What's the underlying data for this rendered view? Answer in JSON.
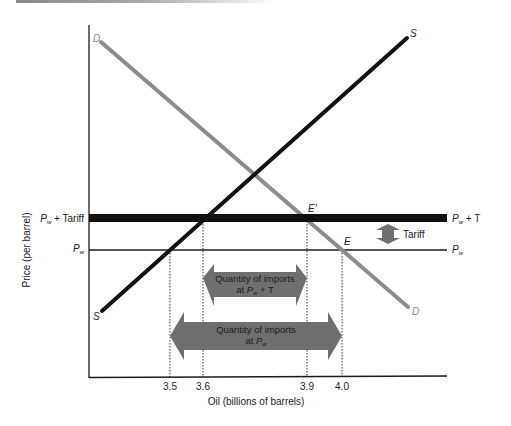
{
  "diagram": {
    "title": "",
    "y_axis_label": "Price (per barrel)",
    "x_axis_label": "Oil (billions of barrels)",
    "x_ticks": [
      {
        "value": "3.5",
        "x": 170
      },
      {
        "value": "3.6",
        "x": 203
      },
      {
        "value": "3.9",
        "x": 307
      },
      {
        "value": "4.0",
        "x": 342
      }
    ],
    "price_levels": {
      "tariff_left_label_main": "P",
      "tariff_left_label_sub": "w",
      "tariff_left_label_rest": " + Tariff",
      "world_left_label_main": "P",
      "world_left_label_sub": "w",
      "tariff_right_label_main": "P",
      "tariff_right_label_sub": "w",
      "tariff_right_label_rest": " + T",
      "world_right_label_main": "P",
      "world_right_label_sub": "w"
    },
    "curves": {
      "supply_label_top": "S",
      "supply_label_bottom": "S",
      "demand_label_top": "D",
      "demand_label_bottom": "D",
      "supply_color": "#111111",
      "demand_color": "#8c8c8c"
    },
    "points": {
      "e_prime": "E'",
      "e": "E"
    },
    "tariff_arrow_label": "Tariff",
    "imports_with_tariff": {
      "line1": "Quantity of imports",
      "line2_prefix": "at ",
      "line2_main": "P",
      "line2_sub": "w",
      "line2_rest": " + T"
    },
    "imports_free_trade": {
      "line1": "Quantity of imports",
      "line2_prefix": "at ",
      "line2_main": "P",
      "line2_sub": "w"
    },
    "colors": {
      "arrow_fill": "#6f6f6f",
      "axis": "#1a1a1a",
      "tariff_line": "#111111"
    }
  }
}
